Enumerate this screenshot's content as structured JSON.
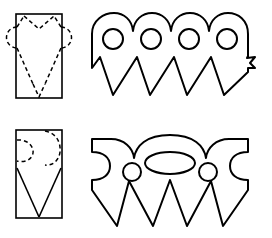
{
  "figure": {
    "background_color": "#ffffff",
    "line_color": "#000000",
    "width": 272,
    "height": 238
  },
  "rows": [
    {
      "id": "row-1",
      "name": "circles-and-points-pattern",
      "folded": {
        "name": "folded-rectangle-top",
        "shape": "rectangle",
        "x": 16,
        "y": 14,
        "width": 46,
        "height": 84,
        "cut_lines_style": "dashed",
        "cut_features": [
          "top-notch-v",
          "upper-left-arc",
          "upper-right-arc",
          "lower-left-diagonal",
          "lower-right-diagonal",
          "bottom-notch-v"
        ]
      },
      "unfolded": {
        "name": "opened-shape-top",
        "scallop_count": 4,
        "hole_count": 4,
        "hole_shape": "circle",
        "hole_radius": 10,
        "point_count": 4,
        "point_style": "zigzag-v",
        "outline_top": "four-rounded-scallops",
        "outline_bottom": "four-sharp-points"
      }
    },
    {
      "id": "row-2",
      "name": "eye-and-circles-pattern",
      "folded": {
        "name": "folded-rectangle-bottom",
        "shape": "rectangle",
        "x": 16,
        "y": 130,
        "width": 46,
        "height": 88,
        "cut_lines_style": "dashed-and-solid",
        "cut_features": [
          "upper-left-arc",
          "upper-right-arc",
          "solid-left-diagonal",
          "solid-right-diagonal",
          "bottom-notch-v"
        ]
      },
      "unfolded": {
        "name": "opened-shape-bottom",
        "scallop_count": 2,
        "hole_count": 3,
        "hole_shape": "two-circles-and-center-ellipse",
        "circle_radius": 8,
        "ellipse_rx": 25,
        "ellipse_ry": 11,
        "point_count": 4,
        "point_style": "zigzag-v",
        "side_notch": "concave-c-curve",
        "outline_top": "central-arch-with-side-wings",
        "outline_bottom": "four-sharp-points"
      }
    }
  ]
}
